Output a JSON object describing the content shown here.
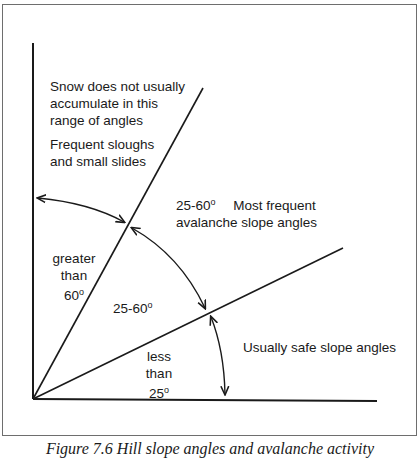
{
  "diagram": {
    "title_caption": "Figure 7.6 Hill slope angles and avalanche activity",
    "zones": {
      "steep": {
        "description": "Snow does not usually accumulate in this range of angles",
        "description_lines": [
          "Snow does not usually",
          "accumulate in this",
          "range of angles"
        ],
        "note_lines": [
          "Frequent sloughs",
          "and small slides"
        ],
        "angle_lines": [
          "greater",
          "than",
          "60"
        ],
        "degree_symbol": "o"
      },
      "avalanche": {
        "range_label": "25-60",
        "degree_symbol": "o",
        "description_line1": "Most frequent",
        "description_line2": "avalanche slope angles",
        "inner_label": "25-60"
      },
      "safe": {
        "angle_lines": [
          "less",
          "than",
          "25"
        ],
        "degree_symbol": "o",
        "description": "Usually safe slope angles"
      }
    },
    "geometry": {
      "origin": [
        33,
        399
      ],
      "vertical_axis_top": [
        33,
        43
      ],
      "line_60_end": [
        203,
        88
      ],
      "line_25_end": [
        343,
        248
      ],
      "horizontal_end": [
        377,
        401
      ]
    },
    "colors": {
      "line": "#1a1a1a",
      "frame": "#6e6e6e",
      "background": "#ffffff"
    }
  }
}
